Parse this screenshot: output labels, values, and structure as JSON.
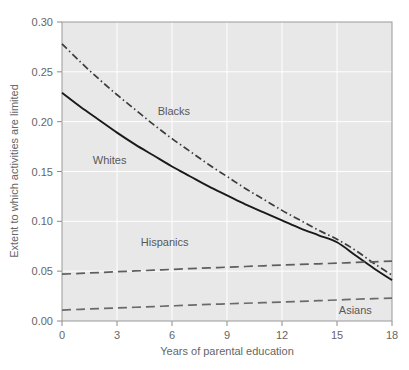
{
  "chart_data": {
    "type": "line",
    "title": "",
    "xlabel": "Years of parental education",
    "ylabel": "Extent to which activities are limited",
    "xlim": [
      0,
      18
    ],
    "ylim": [
      0.0,
      0.3
    ],
    "xticks": [
      "0",
      "3",
      "6",
      "9",
      "12",
      "15",
      "18"
    ],
    "xtick_values": [
      0,
      3,
      6,
      9,
      12,
      15,
      18
    ],
    "yticks": [
      "0.00",
      "0.05",
      "0.10",
      "0.15",
      "0.20",
      "0.25",
      "0.30"
    ],
    "ytick_values": [
      0.0,
      0.05,
      0.1,
      0.15,
      0.2,
      0.25,
      0.3
    ],
    "grid": true,
    "grid_color": "#ffffff",
    "plot_background": "#e8e8e8",
    "legend": "inline-annotations",
    "x": [
      0,
      1,
      2,
      3,
      4,
      5,
      6,
      7,
      8,
      9,
      10,
      11,
      12,
      13,
      14,
      15,
      16,
      17,
      18
    ],
    "series": [
      {
        "name": "Blacks",
        "style": "dash-dot",
        "color": "#3c3c3c",
        "values": [
          0.278,
          0.26,
          0.243,
          0.227,
          0.212,
          0.197,
          0.183,
          0.17,
          0.157,
          0.145,
          0.133,
          0.122,
          0.111,
          0.101,
          0.091,
          0.082,
          0.071,
          0.058,
          0.046
        ],
        "label_x": 6.1,
        "label_y": 0.207
      },
      {
        "name": "Whites",
        "style": "solid",
        "color": "#1a1a1a",
        "values": [
          0.229,
          0.215,
          0.202,
          0.189,
          0.177,
          0.166,
          0.155,
          0.145,
          0.135,
          0.126,
          0.117,
          0.109,
          0.101,
          0.093,
          0.086,
          0.079,
          0.066,
          0.053,
          0.041
        ],
        "label_x": 2.6,
        "label_y": 0.158
      },
      {
        "name": "Hispanics",
        "style": "long-dash",
        "color": "#5e5e5e",
        "values": [
          0.047,
          0.0478,
          0.0486,
          0.0494,
          0.0502,
          0.051,
          0.0518,
          0.0526,
          0.0533,
          0.054,
          0.0547,
          0.0554,
          0.0561,
          0.0568,
          0.0574,
          0.058,
          0.0588,
          0.0594,
          0.06
        ],
        "label_x": 5.6,
        "label_y": 0.0755
      },
      {
        "name": "Asians",
        "style": "long-dash",
        "color": "#6a6a6a",
        "values": [
          0.011,
          0.0117,
          0.0124,
          0.0131,
          0.0138,
          0.0145,
          0.0152,
          0.0159,
          0.0166,
          0.0172,
          0.0178,
          0.0184,
          0.019,
          0.0197,
          0.0204,
          0.0211,
          0.0218,
          0.0224,
          0.023
        ],
        "label_x": 16.0,
        "label_y": 0.0075
      }
    ]
  }
}
